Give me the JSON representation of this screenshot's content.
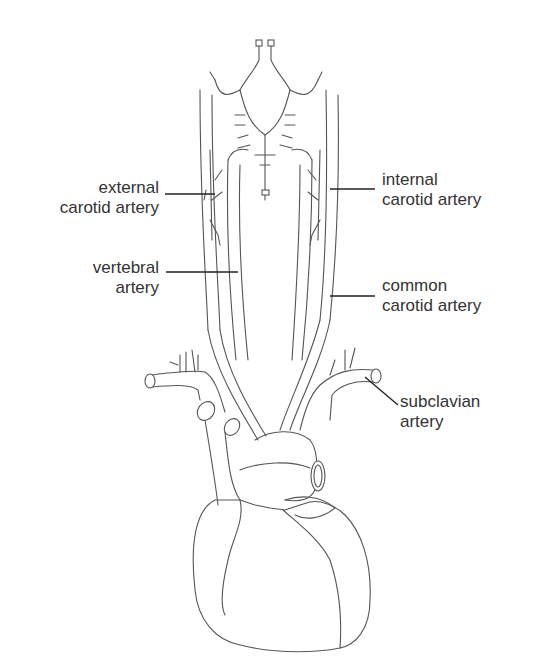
{
  "diagram": {
    "labels": [
      {
        "id": "external",
        "line1": "external",
        "line2": "carotid artery",
        "side": "left"
      },
      {
        "id": "vertebral",
        "line1": "vertebral",
        "line2": "artery",
        "side": "left"
      },
      {
        "id": "internal",
        "line1": "internal",
        "line2": "carotid artery",
        "side": "right"
      },
      {
        "id": "common",
        "line1": "common",
        "line2": "carotid artery",
        "side": "right"
      },
      {
        "id": "subclavian",
        "line1": "subclavian",
        "line2": "artery",
        "side": "right"
      }
    ],
    "colors": {
      "line": "#555555",
      "leader": "#222222",
      "text": "#333333",
      "background": "#ffffff"
    }
  }
}
